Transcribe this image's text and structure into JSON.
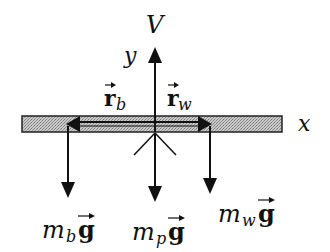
{
  "diagram": {
    "type": "free-body-diagram",
    "axes": {
      "x_label": "x",
      "y_label": "y"
    },
    "forces": {
      "support": {
        "label": "V",
        "direction": "up"
      },
      "weight_b": {
        "mass_label": "m",
        "subscript": "b",
        "vector": "g",
        "direction": "down"
      },
      "weight_p": {
        "mass_label": "m",
        "subscript": "p",
        "vector": "g",
        "direction": "down"
      },
      "weight_w": {
        "mass_label": "m",
        "subscript": "w",
        "vector": "g",
        "direction": "down"
      }
    },
    "position_vectors": {
      "r_b": {
        "symbol": "r",
        "subscript": "b",
        "direction": "left"
      },
      "r_w": {
        "symbol": "r",
        "subscript": "w",
        "direction": "right"
      }
    },
    "arrow_over": "⃗",
    "colors": {
      "ink": "#111111",
      "bar_fill": "#b8b8b8",
      "bar_border": "#222222"
    }
  }
}
